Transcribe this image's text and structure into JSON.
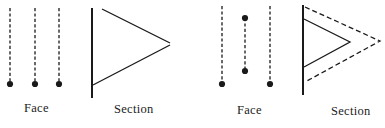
{
  "figure": {
    "panels": [
      {
        "id": "left",
        "face": {
          "label": "Face",
          "label_pos": {
            "x": 24,
            "y": 102
          },
          "lines": [
            {
              "x": 10,
              "y1": 8,
              "y2": 84,
              "style": "dashed",
              "dots": [
                84
              ]
            },
            {
              "x": 35,
              "y1": 8,
              "y2": 84,
              "style": "dashed",
              "dots": [
                84
              ]
            },
            {
              "x": 59,
              "y1": 8,
              "y2": 84,
              "style": "dashed",
              "dots": [
                84
              ]
            }
          ]
        },
        "section": {
          "label": "Section",
          "label_pos": {
            "x": 114,
            "y": 103
          },
          "wall": {
            "x": 92,
            "y1": 8,
            "y2": 98
          },
          "polylines": [
            {
              "points": "102,9 170,43",
              "style": "solid"
            },
            {
              "points": "170,45 93,85",
              "style": "solid"
            }
          ]
        }
      },
      {
        "id": "right",
        "face": {
          "label": "Face",
          "label_pos": {
            "x": 237,
            "y": 104
          },
          "lines": [
            {
              "x": 222,
              "y1": 6,
              "y2": 84,
              "style": "dashed",
              "dots": [
                84
              ]
            },
            {
              "x": 245,
              "y1": 18,
              "y2": 71,
              "style": "dashed",
              "dots": [
                18,
                71
              ]
            },
            {
              "x": 270,
              "y1": 6,
              "y2": 84,
              "style": "dashed",
              "dots": [
                84
              ]
            }
          ]
        },
        "section": {
          "label": "Section",
          "label_pos": {
            "x": 331,
            "y": 105
          },
          "wall": {
            "x": 303,
            "y1": 5,
            "y2": 95
          },
          "polylines": [
            {
              "points": "304,19 350,42 304,67",
              "style": "solid"
            },
            {
              "points": "305,7 380,41 305,82",
              "style": "dashed"
            }
          ]
        }
      }
    ],
    "colors": {
      "stroke": "#1a1a1a",
      "text": "#222222",
      "background": "#ffffff"
    }
  }
}
